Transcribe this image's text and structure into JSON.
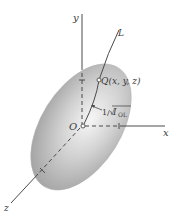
{
  "figure": {
    "labels": {
      "y_axis": "y",
      "x_axis": "x",
      "z_axis": "z",
      "line": "L",
      "origin": "O",
      "point": "Q(x, y, z)",
      "distance_prefix": "1/√",
      "distance_symbol": "I",
      "distance_subscript": "OL"
    },
    "colors": {
      "ellipsoid_light": "#f4f4f4",
      "ellipsoid_mid": "#c8c8c8",
      "ellipsoid_dark": "#9a9a9a",
      "lines": "#4a4a4a",
      "text": "#3a3a3a"
    }
  }
}
